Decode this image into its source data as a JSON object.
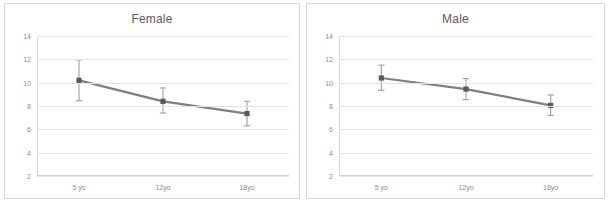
{
  "figure": {
    "panels": [
      {
        "name": "female",
        "title": "Female",
        "yticks": [
          "14",
          "12",
          "10",
          "8",
          "6",
          "4",
          "2"
        ],
        "xticks": [
          "5 yo",
          "12yo",
          "18yo"
        ]
      },
      {
        "name": "male",
        "title": "Male",
        "yticks": [
          "14",
          "12",
          "10",
          "8",
          "6",
          "4",
          "2"
        ],
        "xticks": [
          "5 yo",
          "12yo",
          "18yo"
        ]
      }
    ],
    "colors": {
      "series_line": "#7f7f7f",
      "marker": "#595959",
      "error_bar": "#a6a6a6",
      "gridline": "#e4e4e4",
      "tick_label": "#8c8c8c",
      "title": "#595959",
      "panel_border": "#d9d9d9"
    }
  },
  "footer": {
    "fragments": [
      "",
      "",
      "",
      ""
    ]
  },
  "chart_data": [
    {
      "type": "line",
      "title": "Female",
      "xlabel": "",
      "ylabel": "",
      "categories": [
        "5 yo",
        "12yo",
        "18yo"
      ],
      "values": [
        10.2,
        8.4,
        7.35
      ],
      "error_low": [
        8.45,
        7.4,
        6.3
      ],
      "error_high": [
        11.95,
        9.55,
        8.4
      ],
      "ylim": [
        2,
        14
      ],
      "yticks": [
        14,
        12,
        10,
        8,
        6,
        4,
        2
      ],
      "grid": true,
      "legend": "none",
      "markers": "square",
      "error_bars": true
    },
    {
      "type": "line",
      "title": "Male",
      "xlabel": "",
      "ylabel": "",
      "categories": [
        "5 yo",
        "12yo",
        "18yo"
      ],
      "values": [
        10.4,
        9.45,
        8.05
      ],
      "error_low": [
        9.35,
        8.55,
        7.2
      ],
      "error_high": [
        11.5,
        10.35,
        8.95
      ],
      "ylim": [
        2,
        14
      ],
      "yticks": [
        14,
        12,
        10,
        8,
        6,
        4,
        2
      ],
      "grid": true,
      "legend": "none",
      "markers": "square",
      "error_bars": true
    }
  ]
}
